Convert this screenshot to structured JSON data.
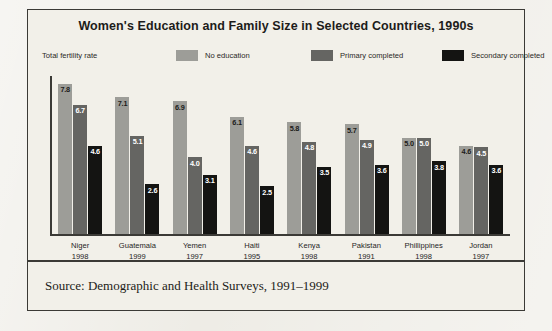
{
  "chart_data": {
    "type": "bar",
    "title": "Women's Education and Family Size in Selected Countries, 1990s",
    "caption": "Total fertility rate",
    "xlabel": "",
    "ylabel": "Total fertility rate",
    "ylim": [
      0,
      8.2
    ],
    "grid": false,
    "legend_position": "top",
    "categories": [
      "Niger",
      "Guatemala",
      "Yemen",
      "Haiti",
      "Kenya",
      "Pakistan",
      "Phillippines",
      "Jordan"
    ],
    "category_years": [
      "1998",
      "1999",
      "1997",
      "1995",
      "1998",
      "1991",
      "1998",
      "1997"
    ],
    "series": [
      {
        "name": "No education",
        "color": "#9d9d98",
        "values": [
          7.8,
          7.1,
          6.9,
          6.1,
          5.8,
          5.7,
          5.0,
          4.6
        ],
        "labels": [
          "7.8",
          "7.1",
          "6.9",
          "6.1",
          "5.8",
          "5.7",
          "5.0",
          "4.6"
        ]
      },
      {
        "name": "Primary completed",
        "color": "#656562",
        "values": [
          6.7,
          5.1,
          4.0,
          4.6,
          4.8,
          4.9,
          5.0,
          4.5
        ],
        "labels": [
          "6.7",
          "5.1",
          "4.0",
          "4.6",
          "4.8",
          "4.9",
          "5.0",
          "4.5"
        ]
      },
      {
        "name": "Secondary completed",
        "color": "#141412",
        "values": [
          4.6,
          2.6,
          3.1,
          2.5,
          3.5,
          3.6,
          3.8,
          3.6
        ],
        "labels": [
          "4.6",
          "2.6",
          "3.1",
          "2.5",
          "3.5",
          "3.6",
          "3.8",
          "3.6"
        ]
      }
    ],
    "source": "Source: Demographic and Health Surveys, 1991–1999"
  }
}
